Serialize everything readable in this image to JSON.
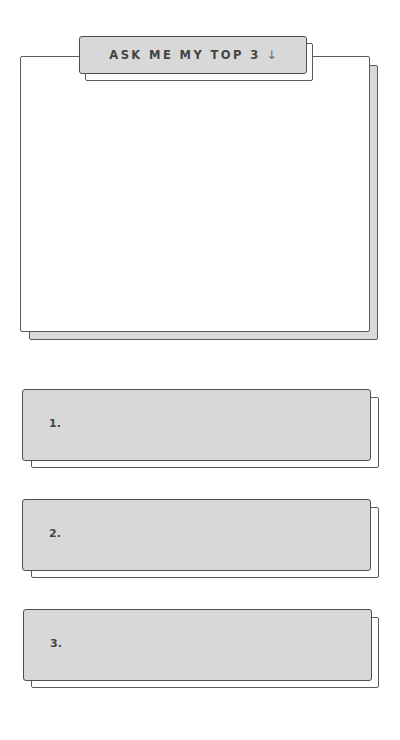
{
  "header": {
    "title": "ASK ME MY TOP 3",
    "arrow_icon": "↓"
  },
  "answer_card": {
    "content": ""
  },
  "list": {
    "items": [
      {
        "label": "1.",
        "value": ""
      },
      {
        "label": "2.",
        "value": ""
      },
      {
        "label": "3.",
        "value": ""
      }
    ]
  },
  "colors": {
    "box_fill": "#d8d8d8",
    "border": "#5a5a5a",
    "text": "#444444",
    "background": "#ffffff"
  }
}
